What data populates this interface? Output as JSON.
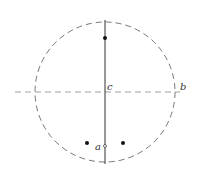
{
  "diagram": {
    "circle": {
      "cx": 105,
      "cy": 92,
      "r": 70,
      "stroke": "#555555",
      "style": "dashed"
    },
    "vertical_line": {
      "x": 105,
      "y1": 20,
      "y2": 164,
      "stroke": "#333333",
      "style": "solid"
    },
    "horizontal_line": {
      "y": 92,
      "x1": 15,
      "x2": 180,
      "stroke": "#888888",
      "style": "dashed"
    },
    "points": [
      {
        "name": "top-dot",
        "x": 105,
        "y": 38,
        "filled": true
      },
      {
        "name": "left-dot",
        "x": 87,
        "y": 143,
        "filled": true
      },
      {
        "name": "right-dot",
        "x": 123,
        "y": 143,
        "filled": true
      },
      {
        "name": "point-a",
        "x": 105,
        "y": 146,
        "filled": false
      }
    ],
    "labels": {
      "a": "a",
      "b": "b",
      "c": "c"
    }
  }
}
